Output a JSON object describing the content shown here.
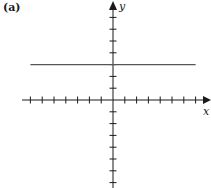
{
  "panel_label": "(a)",
  "chart_data": {
    "type": "line",
    "title": "",
    "xlabel": "x",
    "ylabel": "y",
    "xlim": [
      -7,
      7
    ],
    "ylim": [
      -7,
      7
    ],
    "grid": false,
    "axis_ticks": {
      "x": [
        -7,
        -6,
        -5,
        -4,
        -3,
        -2,
        -1,
        1,
        2,
        3,
        4,
        5,
        6,
        7
      ],
      "y": [
        -7,
        -6,
        -5,
        -4,
        -3,
        -2,
        -1,
        1,
        2,
        3,
        4,
        5,
        6,
        7
      ],
      "tick_labels_shown": false
    },
    "series": [
      {
        "name": "horizontal line y = 3",
        "equation": "y = 3",
        "x": [
          -7,
          7
        ],
        "y": [
          3,
          3
        ]
      }
    ]
  },
  "colors": {
    "axes": "#1a1a1a",
    "line": "#555555"
  }
}
